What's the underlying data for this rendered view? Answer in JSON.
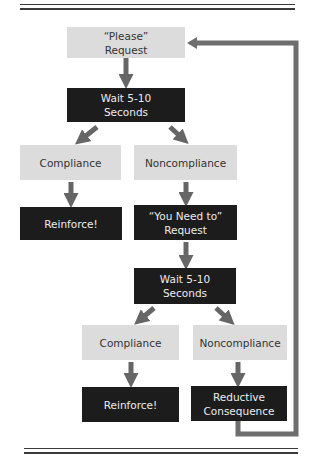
{
  "diagram": {
    "type": "flowchart",
    "colors": {
      "light_box": "#dcdcdc",
      "dark_box": "#1c1c1c",
      "arrow": "#666666",
      "feedback_line": "#6e6e6e"
    },
    "nodes": {
      "please_request": {
        "line1": "“Please”",
        "line2": "Request"
      },
      "wait_1": {
        "line1": "Wait 5-10",
        "line2": "Seconds"
      },
      "compliance_1": {
        "label": "Compliance"
      },
      "noncompliance_1": {
        "label": "Noncompliance"
      },
      "reinforce_1": {
        "label": "Reinforce!"
      },
      "you_need_to_request": {
        "line1": "“You Need to”",
        "line2": "Request"
      },
      "wait_2": {
        "line1": "Wait 5-10",
        "line2": "Seconds"
      },
      "compliance_2": {
        "label": "Compliance"
      },
      "noncompliance_2": {
        "label": "Noncompliance"
      },
      "reinforce_2": {
        "label": "Reinforce!"
      },
      "reductive_consequence": {
        "line1": "Reductive",
        "line2": "Consequence"
      }
    },
    "edges": [
      {
        "from": "please_request",
        "to": "wait_1"
      },
      {
        "from": "wait_1",
        "to": "compliance_1"
      },
      {
        "from": "wait_1",
        "to": "noncompliance_1"
      },
      {
        "from": "compliance_1",
        "to": "reinforce_1"
      },
      {
        "from": "noncompliance_1",
        "to": "you_need_to_request"
      },
      {
        "from": "you_need_to_request",
        "to": "wait_2"
      },
      {
        "from": "wait_2",
        "to": "compliance_2"
      },
      {
        "from": "wait_2",
        "to": "noncompliance_2"
      },
      {
        "from": "compliance_2",
        "to": "reinforce_2"
      },
      {
        "from": "noncompliance_2",
        "to": "reductive_consequence"
      },
      {
        "from": "reductive_consequence",
        "to": "please_request",
        "style": "feedback-loop"
      }
    ]
  }
}
